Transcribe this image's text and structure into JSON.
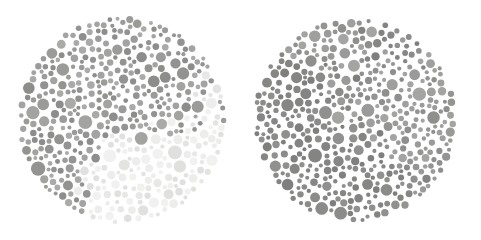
{
  "figure": {
    "type": "ishihara-plate-pair",
    "width": 481,
    "height": 239,
    "background_color": "#ffffff"
  },
  "plates": [
    {
      "id": "plate-left",
      "label": "Left plate",
      "center_x": 122,
      "center_y": 120,
      "radius": 105,
      "contrast": "high",
      "notes": "Pale background dots with clearly darker scattered figure dots; two-tone field is plainly visible.",
      "palette": {
        "background_dots": [
          "#ededeb",
          "#e8e8e6",
          "#e3e3e1",
          "#f1f1ef",
          "#e0e0de"
        ],
        "figure_dots": [
          "#9b9b99",
          "#939391",
          "#8d8d8b",
          "#a3a3a1",
          "#aaaaa8"
        ],
        "figure_ratio": 0.36
      },
      "dot_size": {
        "min": 2.0,
        "max": 8.0
      }
    },
    {
      "id": "plate-right",
      "label": "Right plate",
      "center_x": 355,
      "center_y": 120,
      "radius": 103,
      "contrast": "low",
      "notes": "Nearly uniform medium-gray dots; figure and ground are almost indistinguishable in grayscale.",
      "palette": {
        "background_dots": [
          "#949492",
          "#9a9a98",
          "#8f8f8d",
          "#9f9f9d",
          "#a4a4a2"
        ],
        "figure_dots": [
          "#86868 4",
          "#848482",
          "#8b8b89",
          "#7f7f7d",
          "#909 08e"
        ],
        "figure_ratio": 0.4
      },
      "dot_size": {
        "min": 2.0,
        "max": 7.5
      }
    }
  ],
  "chart_data": {
    "type": "scatter",
    "title": "",
    "xlabel": "",
    "ylabel": "",
    "series": [
      {
        "name": "Left plate background dots",
        "color": "#e8e8e6",
        "approx_count": 300
      },
      {
        "name": "Left plate figure dots",
        "color": "#9b9b99",
        "approx_count": 170
      },
      {
        "name": "Right plate background dots",
        "color": "#9a9a98",
        "approx_count": 290
      },
      {
        "name": "Right plate figure dots",
        "color": "#868684",
        "approx_count": 190
      }
    ]
  }
}
